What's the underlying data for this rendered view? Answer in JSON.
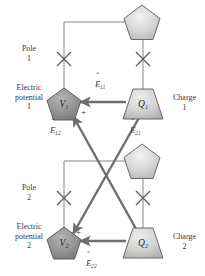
{
  "diagram": {
    "type": "block-diagram",
    "left_labels": [
      {
        "id": "pole-1",
        "text": "Pole\n1",
        "x": 8,
        "y": 44
      },
      {
        "id": "electric-potential-1",
        "text": "Electric\npotential\n1",
        "x": 3,
        "y": 87
      },
      {
        "id": "pole-2",
        "text": "Pole\n2",
        "x": 8,
        "y": 182
      },
      {
        "id": "electric-potential-2",
        "text": "Electric\npotential\n2",
        "x": 3,
        "y": 225
      }
    ],
    "right_labels": [
      {
        "id": "charge-1",
        "text": "Charge\n1",
        "x": 166,
        "y": 93
      },
      {
        "id": "charge-2",
        "text": "Charge\n2",
        "x": 166,
        "y": 231
      }
    ],
    "nodes": [
      {
        "id": "junction-top",
        "shape": "pentagon",
        "label": "",
        "cx": 142,
        "cy": 22,
        "fill": "light"
      },
      {
        "id": "junction-middle",
        "shape": "pentagon",
        "label": "",
        "cx": 142,
        "cy": 161,
        "fill": "light"
      },
      {
        "id": "potential-1",
        "shape": "pentagon",
        "label": "V",
        "sub": "1",
        "cx": 64,
        "cy": 104,
        "fill": "dark"
      },
      {
        "id": "potential-2",
        "shape": "pentagon",
        "label": "V",
        "sub": "2",
        "cx": 64,
        "cy": 243,
        "fill": "dark"
      },
      {
        "id": "charge-1-node",
        "shape": "trapezoid",
        "label": "Q",
        "sub": "1",
        "cx": 143,
        "cy": 104,
        "fill": "light"
      },
      {
        "id": "charge-2-node",
        "shape": "trapezoid",
        "label": "Q",
        "sub": "2",
        "cx": 143,
        "cy": 243,
        "fill": "light"
      }
    ],
    "vector_labels": [
      {
        "id": "e11",
        "symbol": "E",
        "sub": "11",
        "x": 95,
        "y": 84
      },
      {
        "id": "e12",
        "symbol": "E",
        "sub": "12",
        "x": 50,
        "y": 126
      },
      {
        "id": "e21",
        "symbol": "E",
        "sub": "21",
        "x": 130,
        "y": 126
      },
      {
        "id": "e22",
        "symbol": "E",
        "sub": "22",
        "x": 86,
        "y": 259
      }
    ],
    "plus_signs": [
      {
        "id": "plus-1",
        "x": 81,
        "y": 110
      },
      {
        "id": "plus-2",
        "x": 76,
        "y": 230
      }
    ],
    "cross_markers": [
      {
        "id": "cross-pole-1",
        "cx": 64,
        "cy": 59
      },
      {
        "id": "cross-charge-1",
        "cx": 143,
        "cy": 59
      },
      {
        "id": "cross-pole-2",
        "cx": 64,
        "cy": 198
      },
      {
        "id": "cross-charge-2",
        "cx": 143,
        "cy": 198
      }
    ],
    "colors": {
      "thin_line": "#7c7c7c",
      "thick_line": "#6e6e6e",
      "cross": "#5e5e5e",
      "shape_stroke": "#6a6a6a",
      "dark_fill": "#8e8e8e",
      "light_fill": "#cfcfcf",
      "text": "#3a3a3a"
    }
  }
}
